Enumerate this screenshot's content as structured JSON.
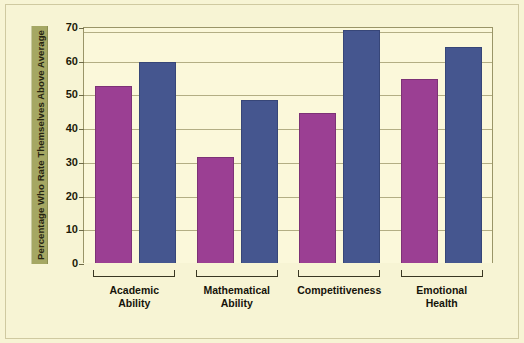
{
  "chart_data": {
    "type": "bar",
    "title": "",
    "xlabel": "",
    "ylabel": "Percentage Who Rate Themselves Above Average",
    "ylim": [
      0,
      70
    ],
    "yticks": [
      70,
      60,
      50,
      40,
      30,
      20,
      10,
      0
    ],
    "grid": true,
    "legend_position": "none",
    "categories": [
      "Academic\nAbility",
      "Mathematical\nAbility",
      "Competitiveness",
      "Emotional\nHealth"
    ],
    "series": [
      {
        "name": "series-1",
        "color": "#9b3f93",
        "values": [
          52.5,
          31.5,
          44.5,
          54.5
        ]
      },
      {
        "name": "series-2",
        "color": "#45568f",
        "values": [
          59.5,
          48.5,
          69.0,
          64.0
        ]
      }
    ]
  },
  "style": {
    "background": "#f7f4d4",
    "plot_background": "#fbf8da",
    "axis_color": "#9a9568",
    "grid_color": "#b3ae84",
    "label_band": "#a5a763"
  }
}
